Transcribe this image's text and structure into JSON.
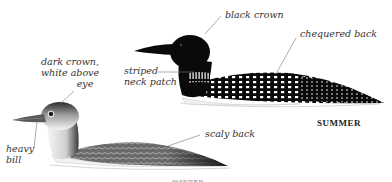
{
  "illustration": {
    "subject": "Common loon plumage comparison",
    "birds": [
      {
        "id": "summer",
        "season_label": "SUMMER",
        "annotations": [
          {
            "id": "black-crown",
            "text": "black crown"
          },
          {
            "id": "chequered-back",
            "text": "chequered back"
          },
          {
            "id": "striped-neck-patch",
            "line1": "striped",
            "line2": "neck patch"
          }
        ]
      },
      {
        "id": "winter",
        "season_label": "WINTER",
        "annotations": [
          {
            "id": "dark-crown",
            "line1": "dark crown,",
            "line2": "white above",
            "line3": "eye"
          },
          {
            "id": "heavy-bill",
            "line1": "heavy",
            "line2": "bill"
          },
          {
            "id": "scaly-back",
            "text": "scaly back"
          }
        ]
      }
    ],
    "colors": {
      "background": "#ffffff",
      "summer_plumage": "#0a0a0a",
      "winter_back": "#555555",
      "winter_belly": "#f2f2f2",
      "leader_lines": "#777777",
      "label_text": "#333333"
    }
  }
}
